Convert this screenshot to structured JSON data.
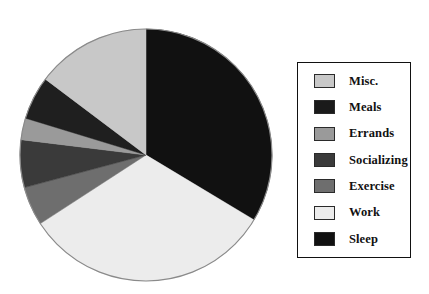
{
  "chart_data": {
    "type": "pie",
    "title": "",
    "subtitle": "",
    "xlabel": "",
    "ylabel": "",
    "legend_position": "right",
    "grid": false,
    "start_angle_deg": 0,
    "direction": "clockwise",
    "center": {
      "x": 128,
      "y": 128
    },
    "radius": 126,
    "categories": [
      "Sleep",
      "Work",
      "Exercise",
      "Socializing",
      "Errands",
      "Meals",
      "Misc."
    ],
    "values": [
      33.6,
      32.2,
      5.0,
      6.1,
      2.8,
      5.6,
      14.7
    ],
    "slices": [
      {
        "label": "Sleep",
        "value": 33.6,
        "start_deg": 0,
        "end_deg": 121,
        "color": "#111111"
      },
      {
        "label": "Work",
        "value": 32.2,
        "start_deg": 121,
        "end_deg": 237,
        "color": "#ececec"
      },
      {
        "label": "Exercise",
        "value": 5.0,
        "start_deg": 237,
        "end_deg": 255,
        "color": "#6e6e6e"
      },
      {
        "label": "Socializing",
        "value": 6.1,
        "start_deg": 255,
        "end_deg": 277,
        "color": "#3a3a3a"
      },
      {
        "label": "Errands",
        "value": 2.8,
        "start_deg": 277,
        "end_deg": 287,
        "color": "#9a9a9a"
      },
      {
        "label": "Meals",
        "value": 5.6,
        "start_deg": 287,
        "end_deg": 307,
        "color": "#1f1f1f"
      },
      {
        "label": "Misc.",
        "value": 14.7,
        "start_deg": 307,
        "end_deg": 360,
        "color": "#c8c8c8"
      }
    ],
    "outline_color": "#8a8a8a",
    "background_color": "#ffffff"
  },
  "legend": {
    "border_color": "#111111",
    "items": [
      {
        "label": "Misc.",
        "color": "#c8c8c8"
      },
      {
        "label": "Meals",
        "color": "#1a1a1a"
      },
      {
        "label": "Errands",
        "color": "#9a9a9a"
      },
      {
        "label": "Socializing",
        "color": "#3a3a3a"
      },
      {
        "label": "Exercise",
        "color": "#6e6e6e"
      },
      {
        "label": "Work",
        "color": "#ececec"
      },
      {
        "label": "Sleep",
        "color": "#111111"
      }
    ]
  }
}
